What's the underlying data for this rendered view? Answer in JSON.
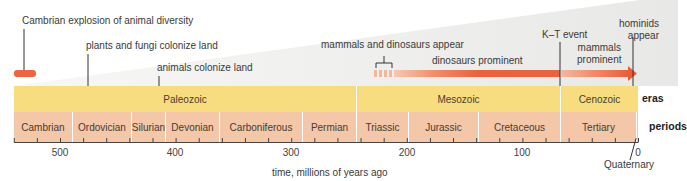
{
  "diagram": {
    "axis": {
      "label": "time, millions of years ago",
      "ticks": [
        500,
        400,
        300,
        200,
        100,
        0
      ],
      "range_ma": [
        545,
        0
      ],
      "minor_tick_interval_ma": 20
    },
    "rows": {
      "eras_label": "eras",
      "periods_label": "periods"
    },
    "eras": [
      {
        "name": "Paleozoic",
        "start_ma": 542,
        "end_ma": 251
      },
      {
        "name": "Mesozoic",
        "start_ma": 251,
        "end_ma": 65
      },
      {
        "name": "Cenozoic",
        "start_ma": 65,
        "end_ma": 0
      }
    ],
    "periods": [
      {
        "name": "Cambrian",
        "start_ma": 542,
        "end_ma": 488
      },
      {
        "name": "Ordovician",
        "start_ma": 488,
        "end_ma": 444
      },
      {
        "name": "Silurian",
        "start_ma": 444,
        "end_ma": 416
      },
      {
        "name": "Devonian",
        "start_ma": 416,
        "end_ma": 359
      },
      {
        "name": "Carboniferous",
        "start_ma": 359,
        "end_ma": 299
      },
      {
        "name": "Permian",
        "start_ma": 299,
        "end_ma": 251
      },
      {
        "name": "Triassic",
        "start_ma": 251,
        "end_ma": 200
      },
      {
        "name": "Jurassic",
        "start_ma": 200,
        "end_ma": 146
      },
      {
        "name": "Cretaceous",
        "start_ma": 146,
        "end_ma": 65
      },
      {
        "name": "Tertiary",
        "start_ma": 65,
        "end_ma": 2
      },
      {
        "name": "Quaternary",
        "start_ma": 2,
        "end_ma": 0
      }
    ],
    "events": {
      "cambrian_explosion": "Cambrian explosion of animal diversity",
      "plants_fungi": "plants and fungi colonize land",
      "animals_land": "animals colonize land",
      "mammals_dinos": "mammals and dinosaurs appear",
      "dinos_prominent": "dinosaurs prominent",
      "kt_event": "K–T event",
      "mammals_prominent_1": "mammals",
      "mammals_prominent_2": "prominent",
      "hominids_1": "hominids",
      "hominids_2": "appear",
      "quaternary": "Quaternary"
    },
    "colors": {
      "era_band": "#f8dc80",
      "period_band": "#f3c7a8",
      "arrow": "#ec6a45",
      "wedge": "#eeeeec"
    }
  }
}
